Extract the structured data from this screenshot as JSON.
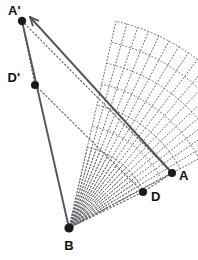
{
  "figure": {
    "canvas": {
      "width": 198,
      "height": 260,
      "background": "#ffffff"
    },
    "colors": {
      "stroke_solid": "#55555d",
      "stroke_dotted": "#6a6a72",
      "point_fill": "#1a1a1a",
      "label_fill": "#111111"
    },
    "points": [
      {
        "id": "A-prime",
        "label": "A'",
        "x": 22,
        "y": 21,
        "r": 4.2,
        "label_x": 8,
        "label_y": 15,
        "label_anchor": "start"
      },
      {
        "id": "D-prime",
        "label": "D'",
        "x": 35,
        "y": 85,
        "r": 4.0,
        "label_x": 20,
        "label_y": 82,
        "label_anchor": "end"
      },
      {
        "id": "B",
        "label": "B",
        "x": 69,
        "y": 228,
        "r": 4.6,
        "label_x": 69,
        "label_y": 250,
        "label_anchor": "middle"
      },
      {
        "id": "A",
        "label": "A",
        "x": 172,
        "y": 173,
        "r": 4.0,
        "label_x": 179,
        "label_y": 180,
        "label_anchor": "start"
      },
      {
        "id": "D",
        "label": "D",
        "x": 143,
        "y": 192,
        "r": 4.0,
        "label_x": 151,
        "label_y": 201,
        "label_anchor": "start"
      }
    ],
    "solid_segments": [
      {
        "id": "image-segment-B-to-Aprime",
        "x1": 69,
        "y1": 228,
        "x2": 22,
        "y2": 21
      }
    ],
    "arrow": {
      "id": "rotation-arrow-A-to-Aprime",
      "x1": 172,
      "y1": 173,
      "x2": 30,
      "y2": 17,
      "head_size": 9
    },
    "dotted_segments": [
      {
        "id": "original-segment-B-to-A",
        "x1": 69,
        "y1": 228,
        "x2": 172,
        "y2": 173
      },
      {
        "id": "original-segment-B-to-D",
        "x1": 69,
        "y1": 228,
        "x2": 143,
        "y2": 192
      },
      {
        "id": "chord-Aprime-to-A",
        "x1": 22,
        "y1": 21,
        "x2": 172,
        "y2": 173
      },
      {
        "id": "chord-Dprime-to-D",
        "x1": 35,
        "y1": 85,
        "x2": 143,
        "y2": 192
      },
      {
        "id": "segment-A-to-D",
        "x1": 172,
        "y1": 173,
        "x2": 143,
        "y2": 192
      },
      {
        "id": "segment-Aprime-to-Dprime",
        "x1": 22,
        "y1": 21,
        "x2": 35,
        "y2": 85
      }
    ],
    "fan_rays": {
      "id": "intermediate-position-rays",
      "center_x": 69,
      "center_y": 228,
      "count": 17,
      "start_angle_deg": -28.1,
      "end_angle_deg": -77.2,
      "radius_long": 212,
      "radius_short": 83
    },
    "arcs": {
      "id": "rotation-path-arcs",
      "center_x": 69,
      "center_y": 228,
      "outer_radius": 212,
      "inner_radius": 83,
      "sweep_start_deg": -28.1,
      "sweep_end_deg": -77.2
    },
    "labels_list": [
      "A'",
      "D'",
      "B",
      "A",
      "D"
    ]
  }
}
